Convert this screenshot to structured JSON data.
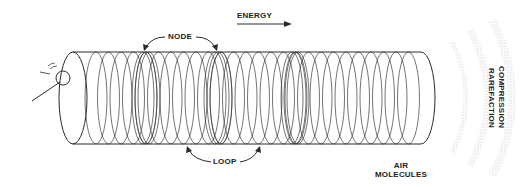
{
  "labels": {
    "energy": "ENERGY",
    "node": "NODE",
    "loop": "LOOP",
    "air_molecules_line1": "AIR",
    "air_molecules_line2": "MOLECULES",
    "compression": "COMPRESSION",
    "rarefaction": "RAREFACTION"
  },
  "colors": {
    "line": "#2a2a2a",
    "wave_stipple": "#bdbdbd",
    "background": "#ffffff"
  }
}
